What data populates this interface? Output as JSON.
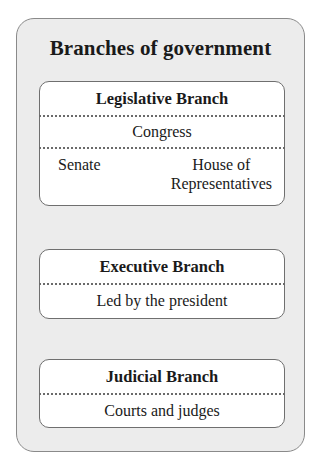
{
  "diagram": {
    "title": "Branches of government",
    "branches": [
      {
        "name": "Legislative Branch",
        "body": "Congress",
        "houses": [
          "Senate",
          "House of Representatives"
        ],
        "houses_display": [
          "Senate",
          "House of",
          "Representatives"
        ]
      },
      {
        "name": "Executive Branch",
        "description": "Led by the president"
      },
      {
        "name": "Judicial Branch",
        "description": "Courts and judges"
      }
    ]
  },
  "colors": {
    "panel_background": "#ececec",
    "panel_border": "#8a8a8a",
    "box_background": "#ffffff",
    "box_border": "#6f6f6f",
    "text": "#1a1a1a"
  }
}
